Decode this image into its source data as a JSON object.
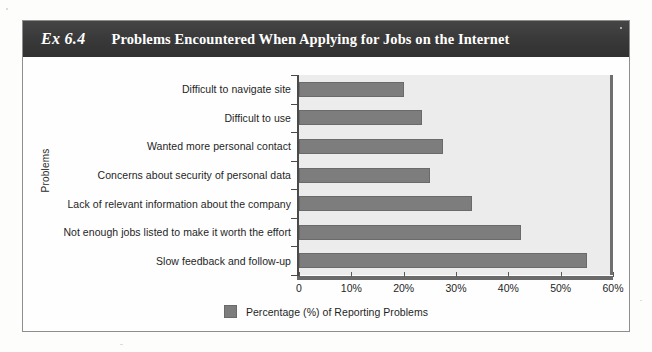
{
  "exhibit": {
    "number": "Ex 6.4",
    "title": "Problems Encountered When Applying for Jobs on the Internet"
  },
  "chart_data": {
    "type": "bar",
    "orientation": "horizontal",
    "title": "Problems Encountered When Applying for Jobs on the Internet",
    "xlabel": "",
    "ylabel": "Problems",
    "xlim": [
      0,
      60
    ],
    "xticks": [
      "0",
      "10%",
      "20%",
      "30%",
      "40%",
      "50%",
      "60%"
    ],
    "xtick_values": [
      0,
      10,
      20,
      30,
      40,
      50,
      60
    ],
    "grid": false,
    "legend_position": "bottom",
    "legend": [
      "Percentage (%) of Reporting Problems"
    ],
    "series_name": "Percentage (%) of Reporting Problems",
    "bar_color": "#7d7d7d",
    "plot_background": "#ececec",
    "categories": [
      "Difficult to navigate site",
      "Difficult to use",
      "Wanted more personal contact",
      "Concerns about security of personal data",
      "Lack of relevant information about the company",
      "Not enough jobs listed to make it worth the effort",
      "Slow feedback and follow-up"
    ],
    "values": [
      20,
      23.5,
      27.5,
      25,
      33,
      42.5,
      55
    ]
  },
  "legend": {
    "label": "Percentage (%) of Reporting Problems"
  }
}
